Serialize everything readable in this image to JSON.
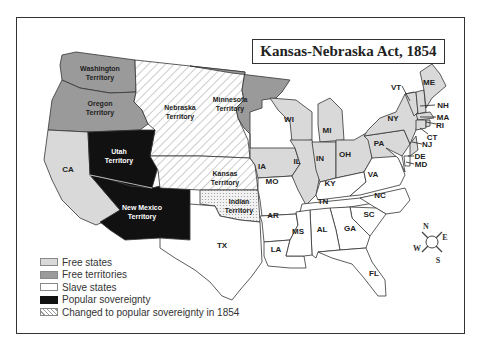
{
  "title": "Kansas-Nebraska Act, 1854",
  "colors": {
    "free_state": "#d9d9d9",
    "free_territory": "#9a9a9a",
    "slave_state": "#ffffff",
    "popular_sovereignty": "#111111",
    "changed_1854": "hatched"
  },
  "territories": {
    "washington": [
      "Washington",
      "Territory"
    ],
    "oregon": [
      "Oregon",
      "Territory"
    ],
    "nebraska": [
      "Nebraska",
      "Territory"
    ],
    "minnesota": [
      "Minnesota",
      "Territory"
    ],
    "utah": [
      "Utah",
      "Territory"
    ],
    "new_mexico": [
      "New Mexico",
      "Territory"
    ],
    "kansas": [
      "Kansas",
      "Territory"
    ],
    "indian": [
      "Indian",
      "Territory"
    ]
  },
  "states": {
    "CA": "CA",
    "IA": "IA",
    "WI": "WI",
    "MI": "MI",
    "IL": "IL",
    "IN": "IN",
    "OH": "OH",
    "PA": "PA",
    "NY": "NY",
    "VT": "VT",
    "ME": "ME",
    "NH": "NH",
    "MA": "MA",
    "RI": "RI",
    "CT": "CT",
    "NJ": "NJ",
    "DE": "DE",
    "MD": "MD",
    "MO": "MO",
    "KY": "KY",
    "VA": "VA",
    "AR": "AR",
    "TN": "TN",
    "NC": "NC",
    "SC": "SC",
    "MS": "MS",
    "AL": "AL",
    "GA": "GA",
    "LA": "LA",
    "TX": "TX",
    "FL": "FL"
  },
  "compass": {
    "N": "N",
    "S": "S",
    "E": "E",
    "W": "W"
  },
  "legend": [
    {
      "key": "free_state",
      "label": "Free states"
    },
    {
      "key": "free_territory",
      "label": "Free territories"
    },
    {
      "key": "slave_state",
      "label": "Slave states"
    },
    {
      "key": "popular_sovereignty",
      "label": "Popular sovereignty"
    },
    {
      "key": "changed_1854",
      "label": "Changed to popular sovereignty in 1854"
    }
  ]
}
